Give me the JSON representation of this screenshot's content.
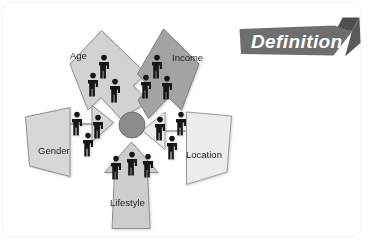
{
  "slide": {
    "background_color": "#ffffff",
    "frame_border_color": "#f3f3f3"
  },
  "banner": {
    "label": "Definition",
    "fill_color": "#6e6e6e",
    "fold_color": "#4f4f4f",
    "text_color": "#ffffff",
    "shape": "right-pointing-ribbon-arrow"
  },
  "hub": {
    "name": "center-hub",
    "fill_color": "#8c8c8c",
    "stroke_color": "#6f6f6f",
    "cx": 132,
    "cy": 125,
    "r": 13
  },
  "figure": {
    "color": "#151515",
    "icon_name": "person-icon",
    "count_per_segment": 3
  },
  "diagram": {
    "type": "radial-arrow-cluster",
    "title_present": false,
    "segment_count": 5,
    "segments": [
      {
        "id": "age",
        "label": "Age",
        "fill_color": "#d2d2d2",
        "stroke_color": "#8f8f8f",
        "angle_deg": -126,
        "people": 3
      },
      {
        "id": "income",
        "label": "Income",
        "fill_color": "#a3a3a3",
        "stroke_color": "#7c7c7c",
        "angle_deg": -54,
        "people": 3
      },
      {
        "id": "gender",
        "label": "Gender",
        "fill_color": "#d7d7d7",
        "stroke_color": "#8f8f8f",
        "angle_deg": 174,
        "people": 3
      },
      {
        "id": "location",
        "label": "Location",
        "fill_color": "#ececec",
        "stroke_color": "#9a9a9a",
        "angle_deg": 6,
        "people": 3
      },
      {
        "id": "lifestyle",
        "label": "Lifestyle",
        "fill_color": "#cdcdcd",
        "stroke_color": "#8f8f8f",
        "angle_deg": 90,
        "people": 3
      }
    ]
  },
  "labels": {
    "age": "Age",
    "income": "Income",
    "gender": "Gender",
    "location": "Location",
    "lifestyle": "Lifestyle"
  }
}
